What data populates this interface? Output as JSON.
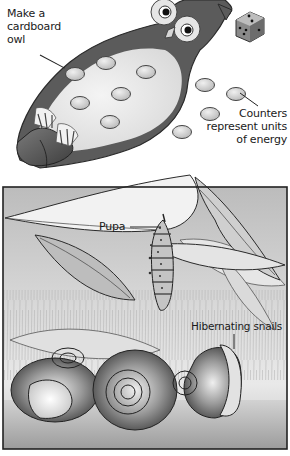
{
  "top_panel": {
    "title": "Owl energy game",
    "labels": {
      "owl_line1": "Make a",
      "owl_line2": "cardboard",
      "owl_line3": "owl",
      "counters_line1": "Counters",
      "counters_line2": "represent units",
      "counters_line3": "of energy"
    },
    "objects": [
      "cardboard-owl",
      "die",
      "energy-counters"
    ],
    "counter_count_on_owl": 7,
    "counter_count_loose": 4
  },
  "bottom_panel": {
    "title": "Overwintering scene",
    "labels": {
      "pupa": "Pupa",
      "snails": "Hibernating snails"
    },
    "objects": [
      "leaves",
      "pupa",
      "grass",
      "snail-shells"
    ],
    "snail_count": 3
  },
  "colors": {
    "background": "#ffffff",
    "owl_dark": "#5a5a5a",
    "owl_light": "#e8e8e8",
    "counter_fill": "#d9d9d9",
    "frame": "#222222",
    "text": "#1a1a1a"
  }
}
